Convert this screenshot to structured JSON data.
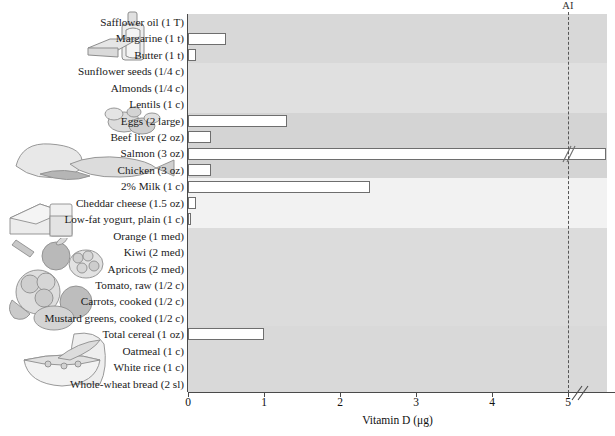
{
  "chart_data": {
    "type": "bar",
    "title": "",
    "xlabel": "Vitamin D (μg)",
    "ylabel": "",
    "orientation": "horizontal",
    "xlim": [
      0,
      5.5
    ],
    "xticks": [
      0,
      1,
      2,
      3,
      4,
      5
    ],
    "xticklabels": [
      "0",
      "1",
      "2",
      "3",
      "4",
      "5"
    ],
    "grid": false,
    "legend": "none",
    "axis_break": {
      "present": true,
      "after_value": 5,
      "series": "Salmon (3 oz)"
    },
    "reference_line": {
      "label": "AI",
      "value": 5,
      "style": "dashed"
    },
    "categories": [
      "Safflower oil (1 T)",
      "Margarine (1 t)",
      "Butter (1 t)",
      "Sunflower seeds (1/4 c)",
      "Almonds (1/4 c)",
      "Lentils (1 c)",
      "Eggs (2 large)",
      "Beef liver (2 oz)",
      "Salmon (3 oz)",
      "Chicken (3 oz)",
      "2% Milk (1 c)",
      "Cheddar cheese (1.5 oz)",
      "Low-fat yogurt, plain (1 c)",
      "Orange (1 med)",
      "Kiwi (2 med)",
      "Apricots (2 med)",
      "Tomato, raw (1/2 c)",
      "Carrots, cooked (1/2 c)",
      "Mustard greens, cooked (1/2 c)",
      "Total cereal (1 oz)",
      "Oatmeal (1 c)",
      "White rice (1 c)",
      "Whole-wheat bread (2 sl)"
    ],
    "values": [
      0,
      0.5,
      0.1,
      0,
      0,
      0,
      1.3,
      0.3,
      5.5,
      0.3,
      2.4,
      0.1,
      0.03,
      0,
      0,
      0,
      0,
      0,
      0,
      1.0,
      0,
      0,
      0
    ],
    "groups": [
      {
        "name": "fats-oils",
        "start": 0,
        "count": 3
      },
      {
        "name": "nuts-legumes",
        "start": 3,
        "count": 3
      },
      {
        "name": "protein-foods",
        "start": 6,
        "count": 4
      },
      {
        "name": "dairy",
        "start": 10,
        "count": 3
      },
      {
        "name": "fruits-vegetables",
        "start": 13,
        "count": 6
      },
      {
        "name": "grains",
        "start": 19,
        "count": 4
      }
    ]
  },
  "axis": {
    "x_title": "Vitamin D (μg)",
    "tick_0": "0",
    "tick_1": "1",
    "tick_2": "2",
    "tick_3": "3",
    "tick_4": "4",
    "tick_5": "5"
  },
  "reference": {
    "ai_label": "AI"
  },
  "artwork": [
    {
      "name": "oil-bottle-margarine-icon"
    },
    {
      "name": "lentils-nuts-icon"
    },
    {
      "name": "poultry-fish-icon"
    },
    {
      "name": "cheese-milk-icon"
    },
    {
      "name": "fruits-vegetables-icon"
    },
    {
      "name": "bread-cereal-bowl-icon"
    }
  ]
}
